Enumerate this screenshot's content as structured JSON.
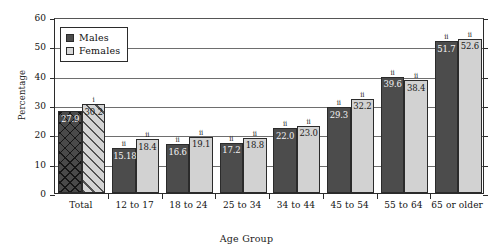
{
  "chart_data": {
    "type": "bar",
    "title": "",
    "xlabel": "Age Group",
    "ylabel": "Percentage",
    "ylim": [
      0,
      60
    ],
    "yticks": [
      0,
      10,
      20,
      30,
      40,
      50,
      60
    ],
    "grid": true,
    "legend_position": "top-left",
    "categories": [
      "Total",
      "12 to 17",
      "18 to 24",
      "25 to 34",
      "34 to 44",
      "45 to 54",
      "55 to 64",
      "65 or older"
    ],
    "series": [
      {
        "name": "Males",
        "color": "#4c4c4c",
        "values": [
          27.9,
          15.18,
          16.6,
          17.2,
          22.0,
          29.3,
          39.6,
          51.7
        ],
        "labels": [
          "27.9",
          "15.18",
          "16.6",
          "17.2",
          "22.0",
          "29.3",
          "39.6",
          "51.7"
        ],
        "markers": [
          "",
          "ii",
          "ii",
          "ii",
          "ii",
          "ii",
          "ii",
          "ii"
        ],
        "patterns": [
          "crosshatch",
          "solid",
          "solid",
          "solid",
          "solid",
          "solid",
          "solid",
          "solid"
        ]
      },
      {
        "name": "Females",
        "color": "#d2d2d2",
        "values": [
          30.2,
          18.4,
          19.1,
          18.8,
          23.0,
          32.2,
          38.4,
          52.6
        ],
        "labels": [
          "30.2",
          "18.4",
          "19.1",
          "18.8",
          "23.0",
          "32.2",
          "38.4",
          "52.6"
        ],
        "markers": [
          "i",
          "ii",
          "ii",
          "ii",
          "ii",
          "ii",
          "ii",
          "ii"
        ],
        "patterns": [
          "diagonal",
          "solid",
          "solid",
          "solid",
          "solid",
          "solid",
          "solid",
          "solid"
        ]
      }
    ]
  },
  "legend": {
    "items": [
      {
        "label": "Males",
        "key": "male"
      },
      {
        "label": "Females",
        "key": "female"
      }
    ]
  }
}
